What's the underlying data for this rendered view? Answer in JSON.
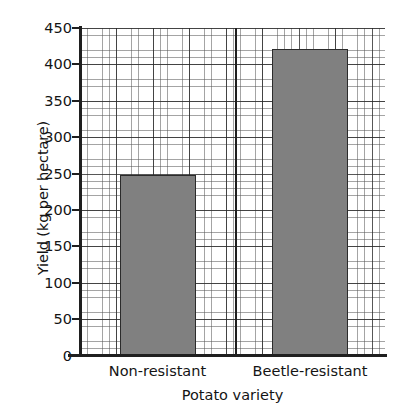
{
  "chart_data": {
    "type": "bar",
    "title": "",
    "subtitle": "",
    "xlabel": "Potato variety",
    "ylabel": "Yield (kg per hectare)",
    "categories": [
      "Non-resistant",
      "Beetle-resistant"
    ],
    "values": [
      248,
      421
    ],
    "ylim": [
      0,
      450
    ],
    "y_ticks": [
      0,
      50,
      100,
      150,
      200,
      250,
      300,
      350,
      400,
      450
    ],
    "y_tick_labels": [
      "0",
      "50",
      "100",
      "150",
      "200",
      "250",
      "300",
      "350",
      "400",
      "450"
    ],
    "y_major_step": 50,
    "y_minor_step": 10,
    "grid": true,
    "grid_style": "graph-paper",
    "legend": null,
    "legend_position": "none",
    "series": [
      {
        "name": "Yield",
        "values": [
          248,
          421
        ],
        "color": "#808080",
        "edge_color": "#2b2b2b"
      }
    ],
    "annotations": [],
    "colors": {
      "bar_fill": "#808080",
      "bar_edge": "#2b2b2b",
      "axis": "#1f1f1f",
      "grid_major": "#282828",
      "grid_minor": "#5a5a5a",
      "background": "#ffffff",
      "text": "#141414"
    }
  },
  "axes": {
    "y_title": "Yield (kg per hectare)",
    "x_title": "Potato variety",
    "y_labels": [
      "450",
      "400",
      "350",
      "300",
      "250",
      "200",
      "150",
      "100",
      "50",
      "0"
    ],
    "x_labels": [
      "Non-resistant",
      "Beetle-resistant"
    ]
  }
}
